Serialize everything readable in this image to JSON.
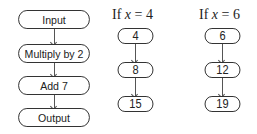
{
  "flowchart": {
    "steps": [
      "Input",
      "Multiply by 2",
      "Add 7",
      "Output"
    ]
  },
  "examples": [
    {
      "header_prefix": "If ",
      "variable": "x",
      "header_suffix": " = 4",
      "values": [
        "4",
        "8",
        "15"
      ]
    },
    {
      "header_prefix": "If ",
      "variable": "x",
      "header_suffix": " = 6",
      "values": [
        "6",
        "12",
        "19"
      ]
    }
  ],
  "colors": {
    "stroke": "#2a2a2a",
    "text": "#222222",
    "background": "#ffffff"
  }
}
